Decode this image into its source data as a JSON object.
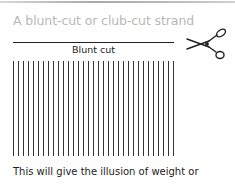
{
  "title": "A blunt-cut or club-cut strand",
  "cut_label": "Blunt cut",
  "caption": "This will give the illusion of weight or",
  "icons": {
    "scissors": "scissors-icon"
  },
  "strands": {
    "count": 33,
    "spacing_px": 5
  },
  "colors": {
    "title": "#b8b8b8",
    "line": "#222222"
  }
}
